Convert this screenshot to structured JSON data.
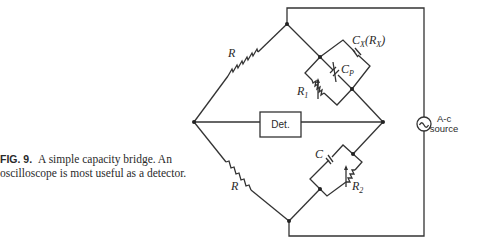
{
  "caption": {
    "figure_label": "FIG. 9.",
    "text": "A simple capacity bridge.  An oscilloscope is most useful as a detector."
  },
  "labels": {
    "upper_left_resistor": "R",
    "lower_left_resistor": "R",
    "cx_main": "C",
    "cx_sub": "X",
    "cx_paren": "(R",
    "cx_paren_sub": "X",
    "cx_paren_close": ")",
    "cp_main": "C",
    "cp_sub": "P",
    "r1_main": "R",
    "r1_sub": "1",
    "c_lower": "C",
    "r2_main": "R",
    "r2_sub": "2",
    "detector": "Det.",
    "source_line1": "A-c",
    "source_line2": "source"
  },
  "icons": {
    "source_symbol": "sine-wave-icon"
  }
}
